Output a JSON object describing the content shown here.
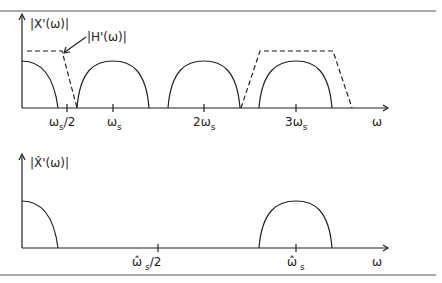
{
  "top_plot": {
    "y_label": "|X'(ω)|",
    "filter_label": "|H'(ω)|",
    "x_axis_label": "ω",
    "ticks": [
      {
        "main": "ω",
        "sub": "s",
        "suffix": "/2"
      },
      {
        "main": "ω",
        "sub": "s",
        "suffix": ""
      },
      {
        "main": "2ω",
        "sub": "s",
        "suffix": ""
      },
      {
        "main": "3ω",
        "sub": "s",
        "suffix": ""
      }
    ]
  },
  "bottom_plot": {
    "y_label": "|X̂'(ω)|",
    "x_axis_label": "ω",
    "ticks": [
      {
        "main": "ω̂",
        "sub": "s",
        "suffix": "/2"
      },
      {
        "main": "ω̂",
        "sub": "s",
        "suffix": ""
      }
    ]
  },
  "colors": {
    "line": "#222222",
    "border": "#555555"
  }
}
